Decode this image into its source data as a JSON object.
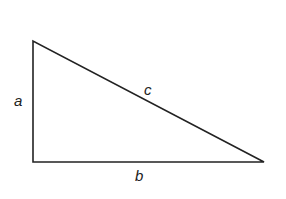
{
  "diagram": {
    "type": "right-triangle",
    "stroke_color": "#222222",
    "background": "#ffffff",
    "vertices": {
      "top": [
        33,
        41
      ],
      "right_angle": [
        33,
        162
      ],
      "right": [
        264,
        162
      ]
    },
    "labels": {
      "a": "a",
      "b": "b",
      "c": "c"
    }
  }
}
